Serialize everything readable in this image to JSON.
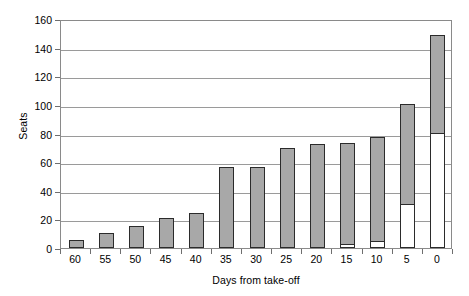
{
  "chart_data": {
    "type": "bar",
    "title": "",
    "xlabel": "Days from take-off",
    "ylabel": "Seats",
    "ylim": [
      0,
      160
    ],
    "ytick_step": 20,
    "yticks": [
      0,
      20,
      40,
      60,
      80,
      100,
      120,
      140,
      160
    ],
    "grid": true,
    "legend": false,
    "stacked": true,
    "categories": [
      "60",
      "55",
      "50",
      "45",
      "40",
      "35",
      "30",
      "25",
      "20",
      "15",
      "10",
      "5",
      "0"
    ],
    "series": [
      {
        "name": "lower-open-segment",
        "fill": "#ffffff",
        "values": [
          0,
          0,
          0,
          0,
          0,
          0,
          0,
          0,
          0,
          2,
          4,
          30,
          80
        ]
      },
      {
        "name": "upper-filled-segment",
        "fill": "#a8a8a8",
        "values": [
          5,
          10,
          15,
          20,
          24,
          56,
          56,
          69,
          72,
          71,
          73,
          70,
          68
        ]
      }
    ],
    "totals": [
      5,
      10,
      15,
      20,
      24,
      56,
      56,
      69,
      72,
      73,
      77,
      100,
      148
    ],
    "colors": {
      "bar_fill": "#a8a8a8",
      "bar_open": "#ffffff",
      "bar_border": "#2b2b2b",
      "gridline": "#9a9a9a",
      "axis": "#8a8a8a",
      "text": "#000000",
      "background": "#ffffff"
    }
  }
}
